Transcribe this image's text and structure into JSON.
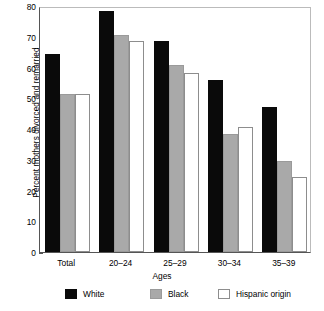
{
  "chart_data": {
    "type": "bar",
    "title": "",
    "subtitle": "",
    "xlabel": "Ages",
    "ylabel": "Percent mothers divorced and remarried",
    "categories": [
      "Total",
      "20–24",
      "25–29",
      "30–34",
      "35–39"
    ],
    "series": [
      {
        "name": "White",
        "color": "#0a0a0a",
        "values": [
          64.5,
          78.5,
          68.5,
          56.0,
          47.0
        ]
      },
      {
        "name": "Black",
        "color": "#a9a9a9",
        "values": [
          51.3,
          70.7,
          60.9,
          38.5,
          29.7
        ]
      },
      {
        "name": "Hispanic origin",
        "color": "#ffffff",
        "values": [
          51.5,
          68.5,
          58.2,
          40.7,
          24.4
        ]
      }
    ],
    "ylim": [
      0,
      80
    ],
    "yticks": [
      0,
      10,
      20,
      30,
      40,
      50,
      60,
      70,
      80
    ],
    "ytick_labels": [
      "0",
      "10",
      "20",
      "30",
      "40",
      "50",
      "60",
      "70",
      "80"
    ],
    "grid": false,
    "legend_position": "bottom"
  },
  "legend": {
    "items": [
      {
        "label": "White",
        "swatch": "black-filled-swatch"
      },
      {
        "label": "Black",
        "swatch": "gray-filled-swatch"
      },
      {
        "label": "Hispanic origin",
        "swatch": "white-outlined-swatch"
      }
    ]
  }
}
